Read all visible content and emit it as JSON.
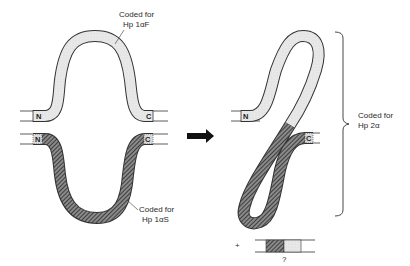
{
  "diagram": {
    "title": "",
    "left": {
      "top_chain": {
        "label_line1": "Coded for",
        "label_line2": "Hp 1αF",
        "n_terminal": "N",
        "c_terminal": "C",
        "fill": "light-stipple"
      },
      "bottom_chain": {
        "label_line1": "Coded for",
        "label_line2": "Hp 1αS",
        "n_terminal": "N",
        "c_terminal": "C",
        "fill": "hatched"
      }
    },
    "arrow": "right-arrow",
    "right": {
      "fused_chain": {
        "n_terminal": "N",
        "c_terminal": "C",
        "bracket_label_line1": "Coded for",
        "bracket_label_line2": "Hp 2α"
      },
      "byproduct": {
        "plus_sign": "+",
        "question_mark": "?"
      }
    }
  },
  "colors": {
    "stroke": "#333333",
    "light_fill": "#e6e6e6",
    "hatch_fill": "#555555",
    "background": "#ffffff"
  }
}
